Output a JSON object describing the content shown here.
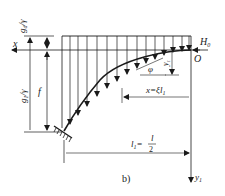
{
  "diagram": {
    "panel_label": "b)",
    "labels": {
      "x_axis": "x",
      "y_axis": "y",
      "y_axis_sub": "1",
      "origin": "O",
      "thrust": "H",
      "thrust_sub": "0",
      "g_d_over_gamma": "g",
      "g_d_sub": "d",
      "g_d_rest": "/γ",
      "g_1_over_gamma": "g",
      "g_1_sub": "1",
      "g_1_rest": "/γ",
      "rise": "f",
      "angle": "φ",
      "y1_local": "y",
      "y1_local_sub": "1",
      "x_eq": "x=ξl",
      "x_eq_sub": "1",
      "half_span_l": "l",
      "half_span_sub": "1",
      "half_span_eq": "=",
      "half_span_num": "l",
      "half_span_den": "2"
    },
    "colors": {
      "line": "#1a1a1a",
      "background": "#ffffff"
    }
  }
}
